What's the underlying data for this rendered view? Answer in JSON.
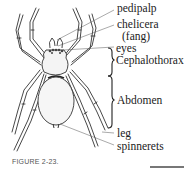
{
  "figure": {
    "caption": "FIGURE 2-23.",
    "labels": {
      "pedipalp": "pedipalp",
      "chelicera": "chelicera",
      "fang": "(fang)",
      "eyes": "eyes",
      "cephalothorax": "Cephalothorax",
      "abdomen": "Abdomen",
      "leg": "leg",
      "spinnerets": "spinnerets"
    }
  }
}
